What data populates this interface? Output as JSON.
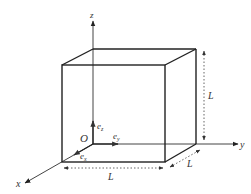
{
  "diagram": {
    "type": "3d-cube-coordinate-system",
    "colors": {
      "edge": "#222222",
      "axis": "#333333",
      "dim": "#555555",
      "background": "#ffffff"
    },
    "axes": {
      "x": {
        "label": "x"
      },
      "y": {
        "label": "y"
      },
      "z": {
        "label": "z"
      }
    },
    "origin": {
      "label": "O"
    },
    "unit_vectors": {
      "ex": {
        "label": "e",
        "sub": "x"
      },
      "ey": {
        "label": "e",
        "sub": "y"
      },
      "ez": {
        "label": "e",
        "sub": "z"
      }
    },
    "dimensions": {
      "height": {
        "label": "L"
      },
      "width": {
        "label": "L"
      },
      "depth": {
        "label": "L"
      }
    }
  }
}
